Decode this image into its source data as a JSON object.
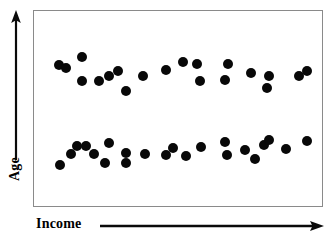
{
  "figure": {
    "kind": "scatter-plot",
    "background_color": "#ffffff",
    "frame_color": "#8a8a8a",
    "point_color": "#080808"
  },
  "axes": {
    "x": {
      "label": "Income",
      "arrow_icon": "arrow-right-icon",
      "direction": "right"
    },
    "y": {
      "label": "Age",
      "arrow_icon": "arrow-up-icon",
      "direction": "up"
    }
  },
  "chart_data": {
    "type": "scatter",
    "title": "",
    "xlabel": "Income",
    "ylabel": "Age",
    "xlim": [
      0,
      100
    ],
    "ylim": [
      0,
      100
    ],
    "grid": false,
    "legend": null,
    "axis_ticks": {
      "x": [],
      "y": []
    },
    "annotations": [],
    "point_radius_px": 5,
    "series": [
      {
        "name": "Older group",
        "cluster": "upper",
        "color": "#080808",
        "points": [
          [
            8.6,
            72.2
          ],
          [
            11.0,
            70.6
          ],
          [
            16.6,
            76.6
          ],
          [
            16.6,
            64.0
          ],
          [
            22.4,
            64.0
          ],
          [
            25.9,
            66.5
          ],
          [
            29.3,
            69.0
          ],
          [
            32.1,
            58.9
          ],
          [
            37.9,
            66.5
          ],
          [
            45.9,
            69.5
          ],
          [
            51.7,
            74.1
          ],
          [
            56.6,
            72.6
          ],
          [
            57.6,
            64.0
          ],
          [
            67.2,
            72.6
          ],
          [
            66.2,
            64.5
          ],
          [
            75.5,
            68.0
          ],
          [
            81.7,
            66.5
          ],
          [
            81.0,
            60.4
          ],
          [
            92.1,
            66.5
          ],
          [
            94.8,
            69.0
          ]
        ]
      },
      {
        "name": "Younger group",
        "cluster": "lower",
        "color": "#080808",
        "points": [
          [
            9.0,
            20.8
          ],
          [
            12.8,
            26.9
          ],
          [
            14.8,
            30.9
          ],
          [
            17.9,
            30.9
          ],
          [
            20.7,
            26.9
          ],
          [
            24.8,
            22.3
          ],
          [
            25.9,
            32.4
          ],
          [
            32.1,
            27.4
          ],
          [
            32.1,
            22.3
          ],
          [
            38.6,
            26.9
          ],
          [
            45.9,
            26.4
          ],
          [
            48.3,
            29.9
          ],
          [
            52.8,
            25.4
          ],
          [
            57.9,
            30.5
          ],
          [
            66.2,
            33.0
          ],
          [
            66.9,
            26.4
          ],
          [
            73.4,
            28.9
          ],
          [
            76.9,
            23.9
          ],
          [
            80.0,
            31.5
          ],
          [
            81.7,
            34.0
          ],
          [
            87.6,
            29.4
          ],
          [
            94.8,
            33.5
          ]
        ]
      }
    ]
  }
}
